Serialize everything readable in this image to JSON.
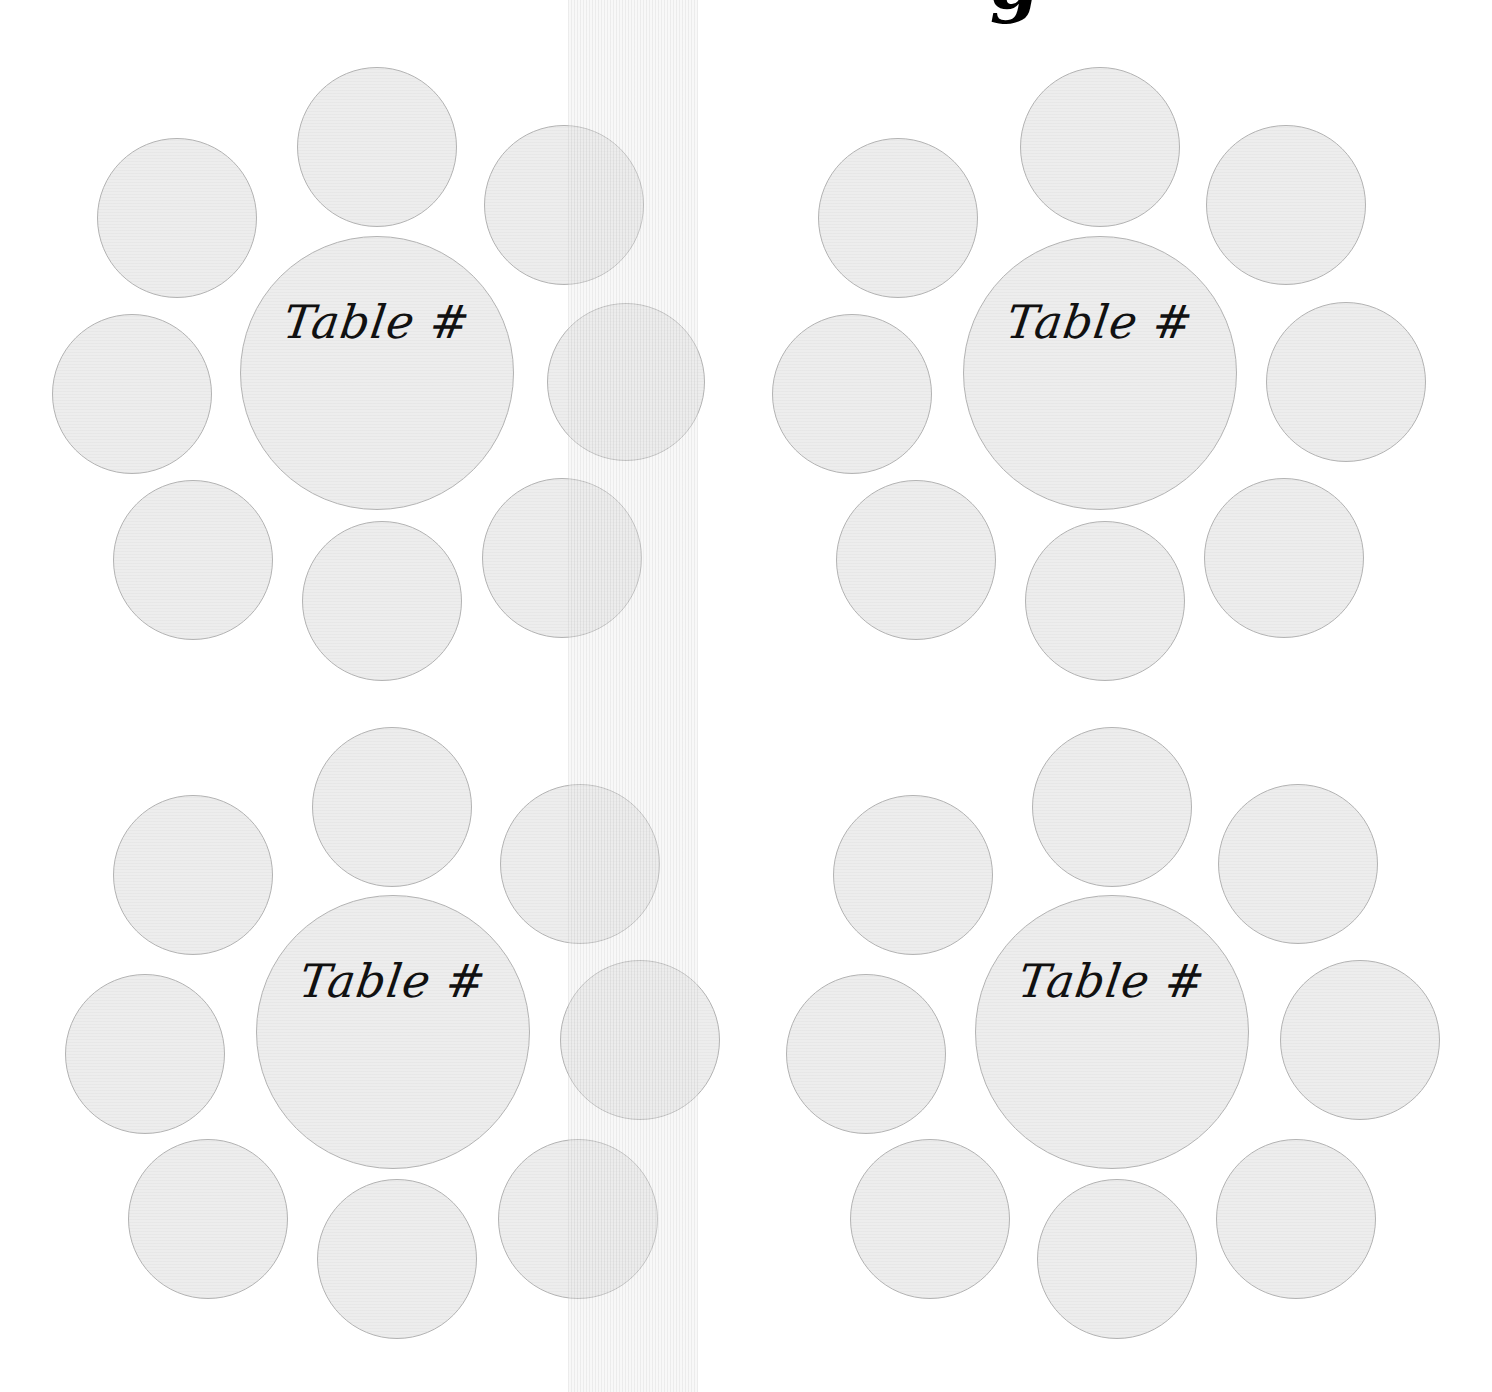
{
  "page": {
    "title_fragment": "g",
    "band": {
      "x": 568,
      "width": 130,
      "color": "#d8d8d8"
    }
  },
  "tables": [
    {
      "label": "Table #",
      "center": {
        "x": 377,
        "y": 373,
        "r": 137
      },
      "seats": [
        {
          "x": 377,
          "y": 147,
          "r": 80
        },
        {
          "x": 177,
          "y": 218,
          "r": 80
        },
        {
          "x": 564,
          "y": 205,
          "r": 80
        },
        {
          "x": 132,
          "y": 394,
          "r": 80
        },
        {
          "x": 626,
          "y": 382,
          "r": 79
        },
        {
          "x": 193,
          "y": 560,
          "r": 80
        },
        {
          "x": 382,
          "y": 601,
          "r": 80
        },
        {
          "x": 562,
          "y": 558,
          "r": 80
        }
      ]
    },
    {
      "label": "Table #",
      "center": {
        "x": 1100,
        "y": 373,
        "r": 137
      },
      "seats": [
        {
          "x": 1100,
          "y": 147,
          "r": 80
        },
        {
          "x": 898,
          "y": 218,
          "r": 80
        },
        {
          "x": 1286,
          "y": 205,
          "r": 80
        },
        {
          "x": 852,
          "y": 394,
          "r": 80
        },
        {
          "x": 1346,
          "y": 382,
          "r": 80
        },
        {
          "x": 916,
          "y": 560,
          "r": 80
        },
        {
          "x": 1105,
          "y": 601,
          "r": 80
        },
        {
          "x": 1284,
          "y": 558,
          "r": 80
        }
      ]
    },
    {
      "label": "Table #",
      "center": {
        "x": 393,
        "y": 1032,
        "r": 137
      },
      "seats": [
        {
          "x": 392,
          "y": 807,
          "r": 80
        },
        {
          "x": 193,
          "y": 875,
          "r": 80
        },
        {
          "x": 580,
          "y": 864,
          "r": 80
        },
        {
          "x": 145,
          "y": 1054,
          "r": 80
        },
        {
          "x": 640,
          "y": 1040,
          "r": 80
        },
        {
          "x": 208,
          "y": 1219,
          "r": 80
        },
        {
          "x": 397,
          "y": 1259,
          "r": 80
        },
        {
          "x": 578,
          "y": 1219,
          "r": 80
        }
      ]
    },
    {
      "label": "Table #",
      "center": {
        "x": 1112,
        "y": 1032,
        "r": 137
      },
      "seats": [
        {
          "x": 1112,
          "y": 807,
          "r": 80
        },
        {
          "x": 913,
          "y": 875,
          "r": 80
        },
        {
          "x": 1298,
          "y": 864,
          "r": 80
        },
        {
          "x": 866,
          "y": 1054,
          "r": 80
        },
        {
          "x": 1360,
          "y": 1040,
          "r": 80
        },
        {
          "x": 930,
          "y": 1219,
          "r": 80
        },
        {
          "x": 1117,
          "y": 1259,
          "r": 80
        },
        {
          "x": 1296,
          "y": 1219,
          "r": 80
        }
      ]
    }
  ]
}
